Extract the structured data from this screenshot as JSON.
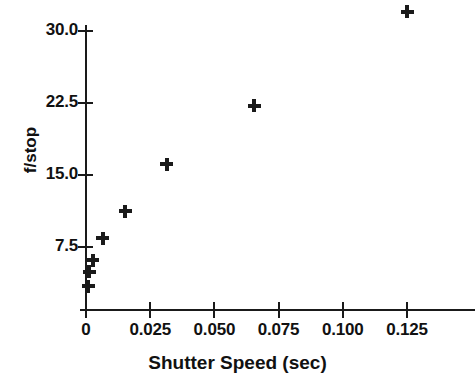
{
  "chart_data": {
    "type": "scatter",
    "title": "",
    "xlabel": "Shutter Speed (sec)",
    "ylabel": "f/stop",
    "xlim": [
      0.0,
      0.151
    ],
    "ylim": [
      2.2,
      33.2
    ],
    "grid": false,
    "legend": null,
    "marker": "plus",
    "marker_color": "#1a1a1a",
    "xticks": [
      0,
      0.025,
      0.05,
      0.075,
      0.1,
      0.125
    ],
    "xticklabels": [
      "0",
      "0.025",
      "0.050",
      "0.075",
      "0.100",
      "0.125"
    ],
    "yticks": [
      7.5,
      15.0,
      22.5,
      30.0
    ],
    "yticklabels": [
      "7.5",
      "15.0",
      "22.5",
      "30.0"
    ],
    "x": [
      0.0008,
      0.0012,
      0.0027,
      0.0066,
      0.0152,
      0.0315,
      0.0655,
      0.125
    ],
    "y": [
      3.4,
      4.9,
      6.1,
      8.4,
      11.2,
      16.1,
      22.2,
      32.0
    ],
    "points": [
      {
        "x": 0.0008,
        "y": 3.4
      },
      {
        "x": 0.0012,
        "y": 4.9
      },
      {
        "x": 0.0027,
        "y": 6.1
      },
      {
        "x": 0.0066,
        "y": 8.4
      },
      {
        "x": 0.0152,
        "y": 11.2
      },
      {
        "x": 0.0315,
        "y": 16.1
      },
      {
        "x": 0.0655,
        "y": 22.2
      },
      {
        "x": 0.125,
        "y": 32.0
      }
    ]
  },
  "axes": {
    "x_title": "Shutter Speed (sec)",
    "y_title": "f/stop",
    "x_tick_labels": [
      "0",
      "0.025",
      "0.050",
      "0.075",
      "0.100",
      "0.125"
    ],
    "y_tick_labels": [
      "7.5",
      "15.0",
      "22.5",
      "30.0"
    ]
  },
  "style": {
    "ink": "#1a1a1a",
    "background": "#ffffff"
  }
}
